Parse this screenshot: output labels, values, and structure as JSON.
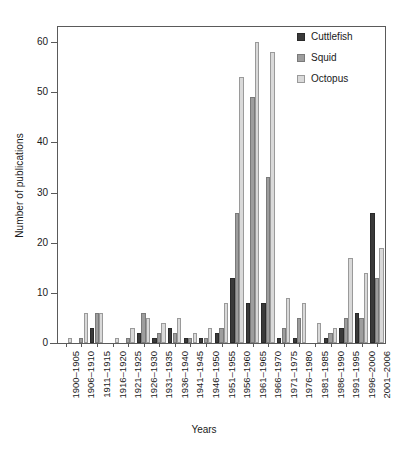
{
  "chart_data": {
    "type": "bar",
    "title": "",
    "xlabel": "Years",
    "ylabel": "Number of publications",
    "ylim": [
      0,
      63
    ],
    "yticks": [
      0,
      10,
      20,
      30,
      40,
      50,
      60
    ],
    "grid": false,
    "legend_position": "top-right",
    "categories": [
      "1900–1905",
      "1906–1910",
      "1911–1915",
      "1916–1920",
      "1921–1925",
      "1926–1930",
      "1931–1935",
      "1936–1940",
      "1941–1945",
      "1946–1950",
      "1951–1955",
      "1956–1960",
      "1961–1965",
      "1966–1970",
      "1971–1975",
      "1976–1980",
      "1981–1985",
      "1986–1990",
      "1991–1995",
      "1996–2000",
      "2001–2006"
    ],
    "series": [
      {
        "name": "Cuttlefish",
        "color": "#3a3a3a",
        "values": [
          0,
          0,
          3,
          0,
          0,
          2,
          1,
          3,
          1,
          1,
          2,
          13,
          8,
          8,
          1,
          1,
          0,
          1,
          3,
          6,
          26
        ]
      },
      {
        "name": "Squid",
        "color": "#9d9d9d",
        "values": [
          0,
          1,
          6,
          0,
          1,
          6,
          2,
          2,
          1,
          1,
          3,
          26,
          49,
          33,
          3,
          5,
          0,
          2,
          5,
          5,
          13
        ]
      },
      {
        "name": "Octopus",
        "color": "#d9d9d9",
        "values": [
          1,
          6,
          6,
          1,
          3,
          5,
          4,
          5,
          2,
          3,
          8,
          53,
          60,
          58,
          9,
          8,
          4,
          3,
          17,
          14,
          19
        ]
      }
    ]
  },
  "legend": {
    "items": [
      {
        "label": "Cuttlefish",
        "key": "cuttlefish"
      },
      {
        "label": "Squid",
        "key": "squid"
      },
      {
        "label": "Octopus",
        "key": "octopus"
      }
    ]
  }
}
